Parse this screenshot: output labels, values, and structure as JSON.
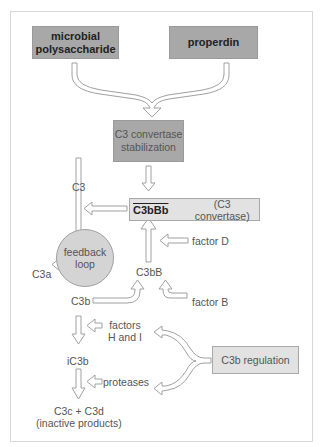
{
  "diagram": {
    "nodes": {
      "microbial_polysaccharide": {
        "line1": "microbial",
        "line2": "polysaccharide"
      },
      "properdin": {
        "label": "properdin"
      },
      "stabilization": {
        "line1": "C3 convertase",
        "line2": "stabilization"
      },
      "convertase": {
        "name": "C3bBb",
        "desc": "(C3 convertase)"
      },
      "c3": {
        "label": "C3"
      },
      "c3a": {
        "label": "C3a"
      },
      "c3b": {
        "label": "C3b"
      },
      "c3bB": {
        "label": "C3bB"
      },
      "feedback": {
        "line1": "feedback",
        "line2": "loop"
      },
      "factor_d": {
        "label": "factor D"
      },
      "factor_b": {
        "label": "factor B"
      },
      "factors_hi": {
        "line1": "factors",
        "line2": "H and I"
      },
      "ic3b": {
        "label": "iC3b"
      },
      "proteases": {
        "label": "proteases"
      },
      "products": {
        "line1": "C3c + C3d",
        "line2": "(inactive products)"
      },
      "regulation": {
        "label": "C3b regulation"
      }
    },
    "colors": {
      "dark_box": "#a8a8a8",
      "light_box": "#e2e2e2",
      "arrow_stroke": "#9a9a9a",
      "text": "#555555"
    }
  }
}
